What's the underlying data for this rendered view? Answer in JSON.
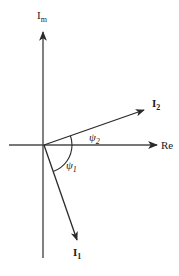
{
  "diagram": {
    "type": "phasor-diagram",
    "axes": {
      "vertical_label_main": "I",
      "vertical_label_sub": "m",
      "horizontal_label": "Re"
    },
    "vectors": [
      {
        "name": "I2",
        "label_main": "I",
        "label_sub": "2",
        "direction": "above real axis"
      },
      {
        "name": "I1",
        "label_main": "I",
        "label_sub": "1",
        "direction": "below real axis"
      }
    ],
    "angles": [
      {
        "name": "psi2",
        "symbol": "ψ",
        "sub": "2",
        "between": [
          "Re",
          "I2"
        ]
      },
      {
        "name": "psi1",
        "symbol": "ψ",
        "sub": "1",
        "between": [
          "Re",
          "I1"
        ]
      }
    ],
    "colors": {
      "axis": "#4a4a4a",
      "vector": "#2a2a2a",
      "background": "#ffffff"
    }
  }
}
